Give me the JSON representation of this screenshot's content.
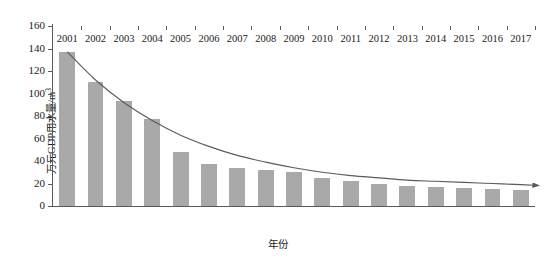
{
  "chart_data": {
    "type": "bar",
    "title": "",
    "subtitle": "",
    "xlabel": "年份",
    "ylabel": "万元GDP用水量/m³",
    "ylabel_base": "万元GDP用水量/m",
    "ylabel_sup": "3",
    "categories": [
      "2001",
      "2002",
      "2003",
      "2004",
      "2005",
      "2006",
      "2007",
      "2008",
      "2009",
      "2010",
      "2011",
      "2012",
      "2013",
      "2014",
      "2015",
      "2016",
      "2017"
    ],
    "values": [
      137,
      110,
      93,
      77,
      48,
      37,
      34,
      32,
      30,
      25,
      22,
      20,
      18,
      17,
      16,
      15,
      14
    ],
    "series": [
      {
        "name": "万元GDP用水量",
        "values": [
          137,
          110,
          93,
          77,
          48,
          37,
          34,
          32,
          30,
          25,
          22,
          20,
          18,
          17,
          16,
          15,
          14
        ]
      }
    ],
    "ylim": [
      0,
      160
    ],
    "y_ticks": [
      0,
      20,
      40,
      60,
      80,
      100,
      120,
      140,
      160
    ],
    "y_tick_labels": [
      "0",
      "20",
      "40",
      "60",
      "80",
      "100",
      "120",
      "140",
      "160"
    ],
    "grid": false,
    "legend": false,
    "legend_position": "none",
    "annotations": [
      {
        "type": "trend-line",
        "name": "declining-trend-arrow",
        "description": "smooth decreasing curve from top-left above 2001 bar to right edge with arrowhead",
        "arrow": true,
        "points": [
          {
            "x": 2001,
            "y": 137
          },
          {
            "x": 2002,
            "y": 112
          },
          {
            "x": 2003,
            "y": 92
          },
          {
            "x": 2004,
            "y": 76
          },
          {
            "x": 2005,
            "y": 63
          },
          {
            "x": 2006,
            "y": 53
          },
          {
            "x": 2007,
            "y": 45
          },
          {
            "x": 2008,
            "y": 39
          },
          {
            "x": 2009,
            "y": 34
          },
          {
            "x": 2010,
            "y": 30
          },
          {
            "x": 2011,
            "y": 27
          },
          {
            "x": 2012,
            "y": 25
          },
          {
            "x": 2013,
            "y": 23
          },
          {
            "x": 2014,
            "y": 22
          },
          {
            "x": 2015,
            "y": 21
          },
          {
            "x": 2016,
            "y": 20
          },
          {
            "x": 2017,
            "y": 19
          }
        ]
      }
    ],
    "colors": {
      "bar": "#a9a9a9",
      "trend_line": "#5a5a5a",
      "axis": "#5a5a5a",
      "text": "#1a1a1a",
      "background": "#ffffff"
    }
  }
}
